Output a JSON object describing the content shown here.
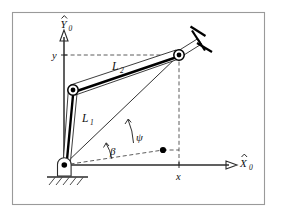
{
  "figure": {
    "background_color": "#ffffff",
    "frame_color": "#9a9a9a",
    "line_color": "#1a1a1a",
    "labels": {
      "x_axis": "X",
      "x_axis_subscript": "0",
      "y_axis": "Y",
      "y_axis_subscript": "0",
      "x_coordinate": "x",
      "y_coordinate": "y",
      "link1": "L",
      "link1_subscript": "1",
      "link2": "L",
      "link2_subscript": "2",
      "angle_beta": "β",
      "angle_psi": "ψ"
    },
    "icons": {
      "x_axis_arrow": "arrow-right-icon",
      "y_axis_arrow": "arrow-up-icon",
      "base_joint": "pin-joint-icon",
      "elbow_joint": "revolute-joint-icon",
      "wrist_joint": "revolute-joint-icon",
      "end_effector": "gripper-icon",
      "ground": "ground-hatch-icon",
      "target_point": "point-marker-icon"
    },
    "geometry": {
      "origin": {
        "x": 64,
        "y": 165
      },
      "elbow": {
        "x": 73,
        "y": 90
      },
      "wrist": {
        "x": 179,
        "y": 55
      },
      "interior_point": {
        "x": 163,
        "y": 150
      },
      "x_tick": {
        "x": 179,
        "y": 165
      },
      "y_tick": {
        "x": 64,
        "y": 58
      }
    }
  }
}
